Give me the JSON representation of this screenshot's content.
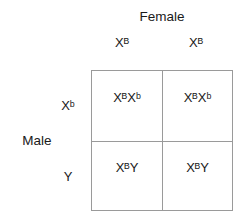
{
  "figure": {
    "type": "punnett-square",
    "female": {
      "title": "Female",
      "alleles": [
        "Xᴮ",
        "Xᴮ"
      ]
    },
    "male": {
      "title": "Male",
      "alleles": [
        "Xᵇ",
        "Y"
      ]
    },
    "grid": {
      "rows": [
        {
          "offspring": [
            "XᴮXᵇ",
            "XᴮXᵇ"
          ]
        },
        {
          "offspring": [
            "XᴮY",
            "XᴮY"
          ]
        }
      ]
    },
    "colors": {
      "text": "#1a1a1a",
      "grid_line": "#9a9a9a",
      "background": "#ffffff"
    }
  }
}
